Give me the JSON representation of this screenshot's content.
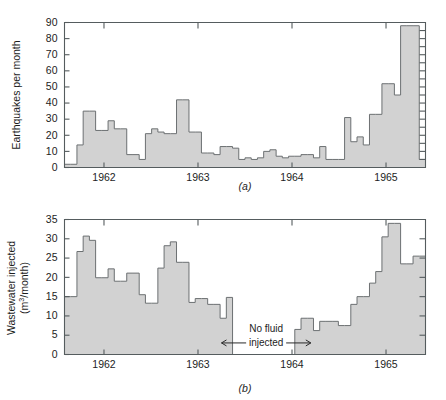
{
  "figure": {
    "background": "#ffffff",
    "bar_fill": "#d2d2d2",
    "bar_stroke": "#6c7072",
    "axis_color": "#555c5e"
  },
  "chart_data": [
    {
      "type": "bar",
      "id": "panel-a",
      "panel_label": "(a)",
      "title": "",
      "xlabel": "",
      "ylabel": "Earthquakes per month",
      "ylim": [
        0,
        90
      ],
      "yticks": [
        0,
        10,
        20,
        30,
        40,
        50,
        60,
        70,
        80,
        90
      ],
      "ytick_labels": [
        "0",
        "10",
        "20",
        "30",
        "40",
        "50",
        "60",
        "70",
        "80",
        "90"
      ],
      "xlim": [
        1961.58,
        1965.42
      ],
      "xticks": [
        1962,
        1963,
        1964,
        1965
      ],
      "xtick_labels": [
        "1962",
        "1963",
        "1964",
        "1965"
      ],
      "grid": false,
      "legend": "none",
      "bin_width_years": 0.08333,
      "x_start": 1961.58,
      "values": [
        2,
        2,
        14,
        35,
        35,
        23,
        23,
        29,
        24,
        24,
        8,
        8,
        5,
        21,
        24,
        22,
        21,
        21,
        42,
        42,
        22,
        22,
        9,
        9,
        8,
        13,
        13,
        12,
        5,
        6,
        5,
        6,
        10,
        11,
        7,
        6,
        7,
        7,
        8,
        8,
        6,
        13,
        5,
        5,
        5,
        31,
        16,
        19,
        14,
        33,
        33,
        52,
        52,
        45,
        88,
        88,
        88,
        5
      ]
    },
    {
      "type": "bar",
      "id": "panel-b",
      "panel_label": "(b)",
      "title": "",
      "xlabel": "",
      "ylabel": "Wastewater injected (m3/month)",
      "ylabel_line1": "Wastewater injected",
      "ylabel_line2_pre": "(m",
      "ylabel_line2_sup": "3",
      "ylabel_line2_post": "/month)",
      "ylim": [
        0,
        35
      ],
      "yticks": [
        0,
        5,
        10,
        15,
        20,
        25,
        30,
        35
      ],
      "ytick_labels": [
        "0",
        "5",
        "10",
        "15",
        "20",
        "25",
        "30",
        "35"
      ],
      "xlim": [
        1961.58,
        1965.42
      ],
      "xticks": [
        1962,
        1963,
        1964,
        1965
      ],
      "xtick_labels": [
        "1962",
        "1963",
        "1964",
        "1965"
      ],
      "grid": false,
      "legend": "none",
      "bin_width_years": 0.08333,
      "x_start": 1961.58,
      "values": [
        15,
        15,
        26.7,
        30.7,
        29.6,
        19.9,
        19.9,
        22.2,
        19,
        19,
        21.1,
        21.1,
        15.5,
        13.3,
        13.3,
        22.4,
        28.2,
        29.2,
        23.9,
        23.9,
        13.5,
        14.5,
        14.5,
        13,
        13,
        9.4,
        14.8,
        0,
        0,
        0,
        0,
        0,
        0,
        0,
        0,
        0,
        0,
        6.5,
        9.4,
        9.4,
        6.2,
        8.6,
        8.6,
        8.6,
        7.5,
        7.5,
        13,
        15,
        15,
        18.5,
        21.5,
        30.5,
        34,
        34,
        23.5,
        23.5,
        25.5,
        25.5
      ],
      "annotation": {
        "line1": "No fluid",
        "line2": "injected",
        "x_start": 1963.25,
        "x_end": 1964.2,
        "y": 3.0
      }
    }
  ]
}
